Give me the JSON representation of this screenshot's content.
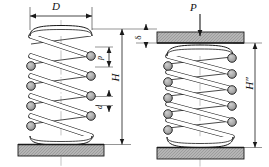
{
  "figure": {
    "background": "#ffffff",
    "width": 269,
    "height": 167
  },
  "colors": {
    "line": "#1a1a1a",
    "wire_fill": "#a8a8a8",
    "plate_fill": "#b3b3b3",
    "plate_edge": "#1a1a1a",
    "thin_line": "#555555",
    "centerline": "#8a8a8a",
    "spring_face": "#ffffff"
  },
  "labels": {
    "coil_diameter": "D",
    "free_height": "H",
    "compressed_height": "H″",
    "pitch": "p",
    "wire_diameter": "d",
    "load": "P",
    "deflection": "δ"
  },
  "left_spring": {
    "name": "free-spring",
    "state": "free",
    "dimension_lines": [
      "D",
      "H",
      "p",
      "d"
    ],
    "active_coils": 5,
    "center_x": 61,
    "outer_left": 28,
    "outer_right": 94,
    "top_y": 28,
    "base_y": 144
  },
  "right_spring": {
    "name": "loaded-spring",
    "state": "compressed",
    "dimension_lines": [
      "H″",
      "δ"
    ],
    "active_coils": 6,
    "center_x": 200,
    "outer_left": 165,
    "outer_right": 235,
    "top_y": 48,
    "base_y": 152
  },
  "load_arrow": {
    "name": "applied-load-arrow",
    "label": "P",
    "direction": "down",
    "x": 200,
    "from_y": 14,
    "to_y": 36
  },
  "plates": {
    "left_base": {
      "x": 18,
      "y": 144,
      "w": 86,
      "h": 12
    },
    "right_top": {
      "x": 158,
      "y": 32,
      "w": 86,
      "h": 12
    },
    "right_base": {
      "x": 158,
      "y": 152,
      "w": 86,
      "h": 12
    }
  }
}
